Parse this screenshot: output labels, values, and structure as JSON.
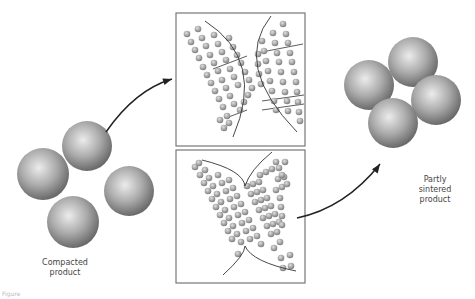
{
  "labels": {
    "compacted": [
      "Compacted",
      "product"
    ],
    "sintered": [
      "Partly",
      "sintered",
      "product"
    ],
    "caption": "Figure"
  },
  "colors": {
    "sphere_light": "#e6e6e6",
    "sphere_mid": "#a8a8a8",
    "sphere_dark": "#6e6e6e",
    "line": "#333333",
    "frame": "#777777"
  },
  "spheres": {
    "compacted": [
      {
        "cx": 43,
        "cy": 174,
        "r": 26
      },
      {
        "cx": 87,
        "cy": 146,
        "r": 25
      },
      {
        "cx": 129,
        "cy": 191,
        "r": 25
      },
      {
        "cx": 73,
        "cy": 222,
        "r": 26
      }
    ],
    "sintered": [
      {
        "cx": 413,
        "cy": 62,
        "r": 25
      },
      {
        "cx": 369,
        "cy": 85,
        "r": 25
      },
      {
        "cx": 436,
        "cy": 100,
        "r": 25
      },
      {
        "cx": 393,
        "cy": 123,
        "r": 25
      }
    ]
  },
  "frames": [
    {
      "name": "grain-boundary-frame",
      "x": 176,
      "y": 13,
      "w": 129,
      "h": 133
    },
    {
      "name": "neck-growth-frame",
      "x": 176,
      "y": 150,
      "w": 129,
      "h": 133
    }
  ],
  "arrows": [
    {
      "name": "arrow-compacted-to-frame",
      "d": "M 106 132 Q 135 90 172 79",
      "head": [
        172,
        79,
        -18
      ]
    },
    {
      "name": "arrow-frame-to-sintered",
      "d": "M 297 218 Q 345 208 380 164",
      "head": [
        380,
        164,
        -55
      ]
    }
  ],
  "neck_curves": [
    "M 205 21 Q 266 60 233 137",
    "M 271 16 Q 232 65 297 132",
    "M 202 160 Q 243 170 245 186 Q 250 170 272 152",
    "M 223 275 Q 245 255 245 246 Q 252 262 296 271"
  ],
  "particles": {
    "top_left_rows": [
      [
        [
          187,
          34
        ],
        [
          191,
          42
        ],
        [
          195,
          50
        ],
        [
          199,
          58
        ],
        [
          203,
          67
        ],
        [
          207,
          75
        ],
        [
          211,
          83
        ],
        [
          215,
          91
        ],
        [
          219,
          99
        ],
        [
          223,
          107
        ],
        [
          227,
          116
        ]
      ],
      [
        [
          198,
          29
        ],
        [
          202,
          38
        ],
        [
          206,
          46
        ],
        [
          210,
          55
        ],
        [
          214,
          63
        ],
        [
          218,
          71
        ],
        [
          222,
          80
        ],
        [
          226,
          88
        ],
        [
          230,
          96
        ],
        [
          234,
          104
        ]
      ],
      [
        [
          214,
          35
        ],
        [
          218,
          44
        ],
        [
          222,
          52
        ],
        [
          226,
          60
        ],
        [
          230,
          69
        ],
        [
          234,
          77
        ],
        [
          238,
          85
        ],
        [
          220,
          120
        ],
        [
          224,
          128
        ],
        [
          229,
          123
        ]
      ],
      [
        [
          229,
          38
        ],
        [
          233,
          47
        ],
        [
          237,
          55
        ],
        [
          241,
          63
        ],
        [
          245,
          72
        ],
        [
          249,
          80
        ],
        [
          252,
          88
        ],
        [
          248,
          95
        ],
        [
          244,
          102
        ],
        [
          240,
          110
        ]
      ]
    ],
    "top_right_rows": [
      [
        [
          283,
          24
        ],
        [
          286,
          34
        ],
        [
          288,
          43
        ],
        [
          290,
          53
        ],
        [
          292,
          62
        ],
        [
          294,
          72
        ],
        [
          296,
          82
        ],
        [
          297,
          92
        ],
        [
          298,
          102
        ],
        [
          299,
          112
        ],
        [
          300,
          121
        ]
      ],
      [
        [
          273,
          33
        ],
        [
          275,
          43
        ],
        [
          277,
          53
        ],
        [
          279,
          62
        ],
        [
          281,
          72
        ],
        [
          283,
          82
        ],
        [
          285,
          92
        ],
        [
          287,
          101
        ],
        [
          288,
          111
        ]
      ],
      [
        [
          262,
          41
        ],
        [
          264,
          51
        ],
        [
          266,
          61
        ],
        [
          268,
          71
        ],
        [
          270,
          81
        ],
        [
          272,
          91
        ],
        [
          274,
          101
        ],
        [
          276,
          110
        ]
      ],
      [
        [
          258,
          54
        ],
        [
          258,
          64
        ],
        [
          259,
          74
        ],
        [
          261,
          84
        ]
      ]
    ],
    "bottom_rows": [
      [
        [
          195,
          167
        ],
        [
          199,
          163
        ],
        [
          200,
          175
        ],
        [
          204,
          183
        ],
        [
          208,
          191
        ],
        [
          212,
          199
        ],
        [
          216,
          207
        ],
        [
          220,
          215
        ],
        [
          224,
          223
        ],
        [
          228,
          231
        ],
        [
          232,
          239
        ]
      ],
      [
        [
          205,
          170
        ],
        [
          209,
          178
        ],
        [
          213,
          186
        ],
        [
          217,
          194
        ],
        [
          221,
          202
        ],
        [
          225,
          210
        ],
        [
          229,
          218
        ],
        [
          233,
          226
        ],
        [
          237,
          234
        ],
        [
          241,
          242
        ]
      ],
      [
        [
          218,
          175
        ],
        [
          222,
          183
        ],
        [
          226,
          191
        ],
        [
          230,
          199
        ],
        [
          234,
          207
        ],
        [
          238,
          215
        ],
        [
          242,
          223
        ],
        [
          246,
          231
        ],
        [
          250,
          239
        ]
      ],
      [
        [
          229,
          180
        ],
        [
          233,
          188
        ],
        [
          237,
          196
        ],
        [
          241,
          204
        ],
        [
          245,
          212
        ],
        [
          249,
          220
        ],
        [
          253,
          228
        ],
        [
          257,
          236
        ],
        [
          261,
          244
        ]
      ],
      [
        [
          247,
          186
        ],
        [
          253,
          184
        ],
        [
          259,
          182
        ],
        [
          251,
          194
        ],
        [
          257,
          192
        ],
        [
          263,
          190
        ],
        [
          255,
          202
        ],
        [
          261,
          200
        ],
        [
          267,
          198
        ],
        [
          259,
          210
        ],
        [
          265,
          208
        ],
        [
          271,
          206
        ],
        [
          263,
          218
        ],
        [
          269,
          216
        ],
        [
          275,
          214
        ],
        [
          267,
          226
        ],
        [
          273,
          224
        ],
        [
          279,
          222
        ],
        [
          271,
          234
        ],
        [
          277,
          232
        ]
      ],
      [
        [
          260,
          175
        ],
        [
          266,
          172
        ],
        [
          272,
          169
        ],
        [
          278,
          179
        ],
        [
          284,
          177
        ],
        [
          276,
          190
        ],
        [
          282,
          187
        ],
        [
          280,
          198
        ],
        [
          281,
          207
        ],
        [
          282,
          216
        ],
        [
          282,
          225
        ],
        [
          280,
          242
        ]
      ],
      [
        [
          276,
          162
        ],
        [
          279,
          168
        ],
        [
          282,
          175
        ],
        [
          285,
          162
        ],
        [
          287,
          184
        ]
      ],
      [
        [
          238,
          254
        ],
        [
          274,
          248
        ],
        [
          281,
          258
        ],
        [
          283,
          268
        ],
        [
          290,
          255
        ],
        [
          291,
          266
        ]
      ]
    ]
  },
  "bond_lines": [
    "M 213 69 L 247 56",
    "M 226 118 L 247 110",
    "M 267 51 L 303 44",
    "M 262 101 L 304 95",
    "M 262 110 L 304 104"
  ]
}
